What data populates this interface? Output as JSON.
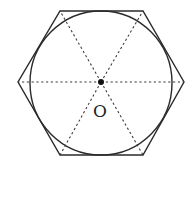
{
  "diagram": {
    "center": {
      "label": "O",
      "x": 101,
      "y": 82
    },
    "hexagon_vertices": [
      {
        "x": 60,
        "y": 11
      },
      {
        "x": 143,
        "y": 11
      },
      {
        "x": 184,
        "y": 82
      },
      {
        "x": 143,
        "y": 155
      },
      {
        "x": 60,
        "y": 155
      },
      {
        "x": 18,
        "y": 82
      }
    ],
    "inscribed_circle": {
      "cx": 101,
      "cy": 83,
      "rx": 71,
      "ry": 72
    },
    "colors": {
      "stroke": "#2a2a2a",
      "dashed": "#3a3a3a",
      "background": "#ffffff"
    }
  }
}
